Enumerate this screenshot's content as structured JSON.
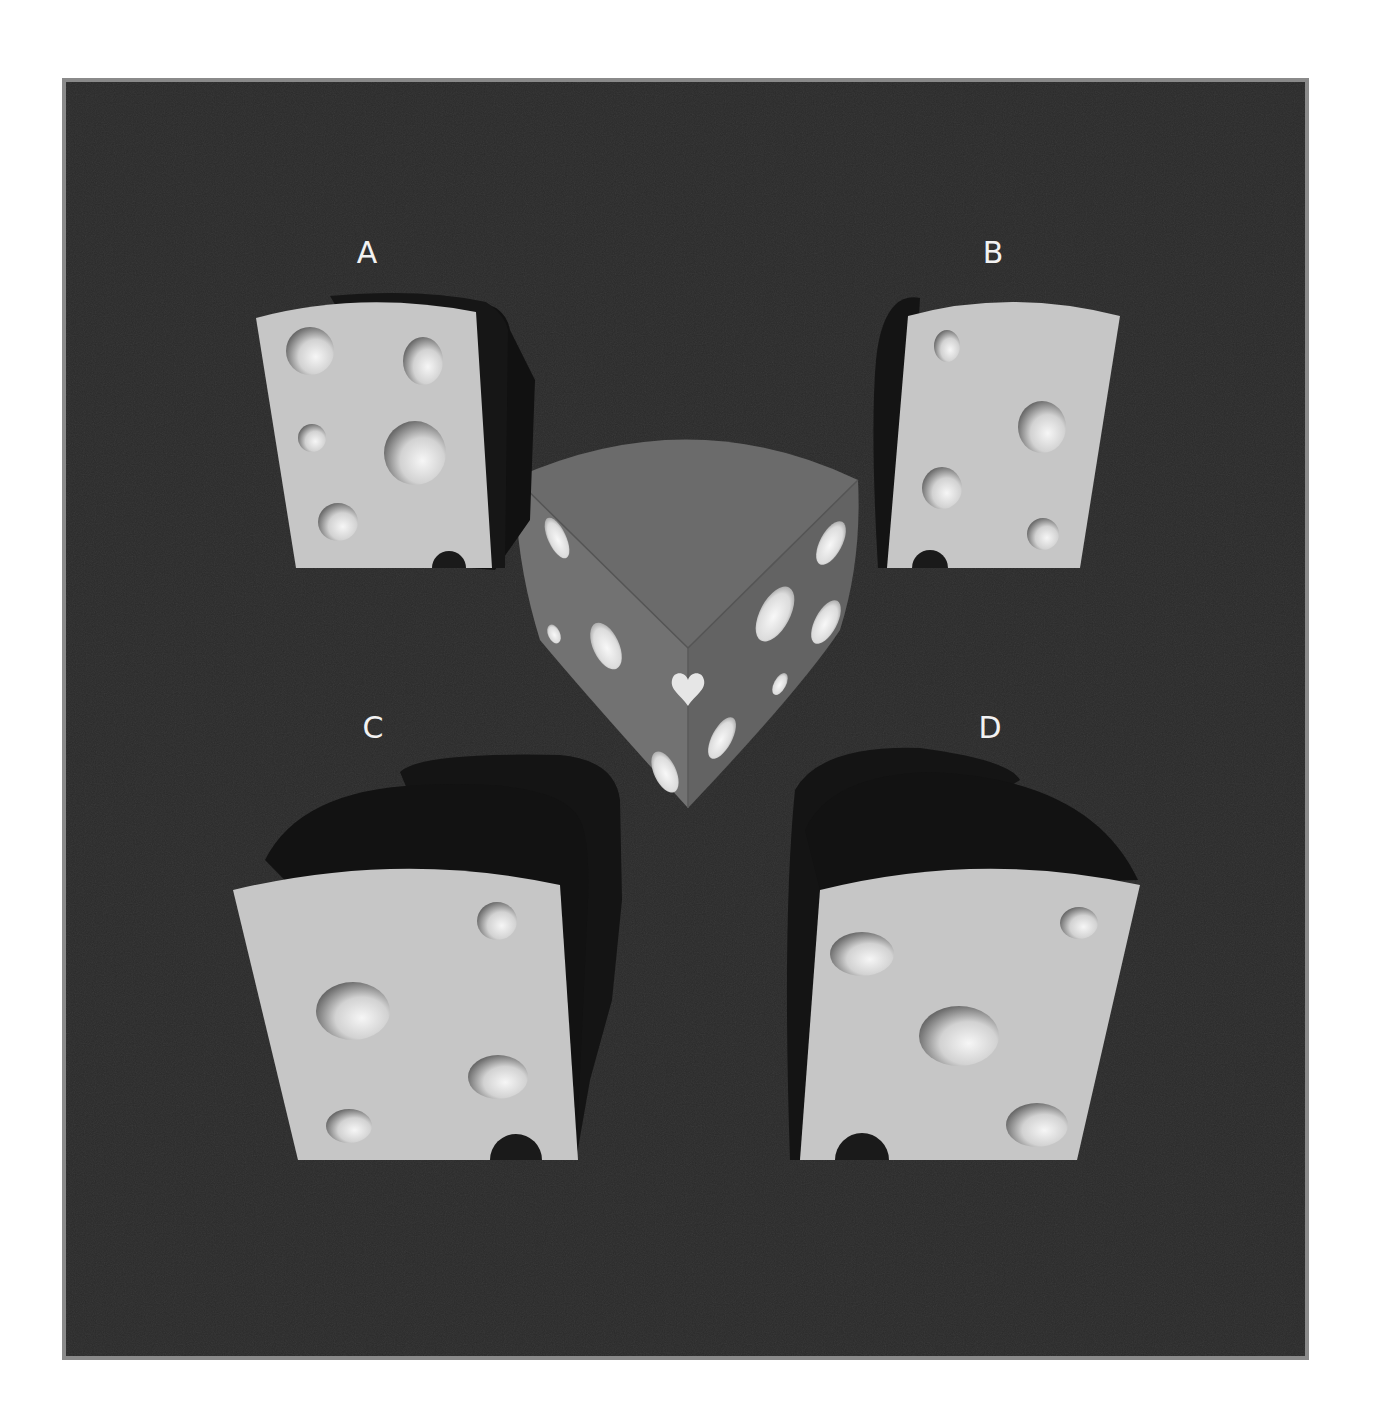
{
  "puzzle": {
    "frame": {
      "x": 64,
      "y": 80,
      "width": 1243,
      "height": 1278,
      "background": "#2a2a2a",
      "border": "#8a8a8a"
    },
    "colors": {
      "cheese_face": "#c8c8c8",
      "cheese_side": "#1c1c1c",
      "shadow": "#151515",
      "wedge_top": "#6e6e6e",
      "wedge_left": "#707070",
      "wedge_right": "#636363",
      "hole_light": "#f4f4f4",
      "hole_dark": "#7a7a7a"
    },
    "reference": {
      "name": "wedge",
      "holes_left_face": 4,
      "holes_right_face": 5,
      "corner_hole_shape": "heart"
    },
    "options": [
      {
        "label": "A",
        "label_x": 367,
        "label_y": 253,
        "holes": 6
      },
      {
        "label": "B",
        "label_x": 993,
        "label_y": 253,
        "holes": 5
      },
      {
        "label": "C",
        "label_x": 373,
        "label_y": 728,
        "holes": 5
      },
      {
        "label": "D",
        "label_x": 990,
        "label_y": 728,
        "holes": 5
      }
    ]
  }
}
